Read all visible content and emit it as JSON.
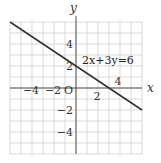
{
  "chart_data": {
    "type": "line",
    "title": "",
    "xlabel": "x",
    "ylabel": "y",
    "xlim": [
      -6,
      6
    ],
    "ylim": [
      -6,
      6
    ],
    "grid": true,
    "grid_step": 1,
    "origin_label": "O",
    "x_ticks": [
      {
        "value": -4,
        "label": "−4"
      },
      {
        "value": -2,
        "label": "−2"
      },
      {
        "value": 2,
        "label": "2"
      },
      {
        "value": 4,
        "label": "4"
      }
    ],
    "y_ticks": [
      {
        "value": 4,
        "label": "4"
      },
      {
        "value": 2,
        "label": "2"
      },
      {
        "value": -2,
        "label": "−2"
      },
      {
        "value": -4,
        "label": "−4"
      }
    ],
    "series": [
      {
        "name": "2x+3y=6",
        "equation": "2x+3y=6",
        "x": [
          -6,
          0,
          3,
          6
        ],
        "y": [
          6,
          2,
          0,
          -2
        ],
        "color": "#333333"
      }
    ],
    "annotations": [
      {
        "text": "2x+3y=6",
        "x": 0.8,
        "y": 2.6
      }
    ]
  }
}
